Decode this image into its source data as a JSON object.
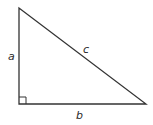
{
  "diagram": {
    "type": "right-triangle",
    "colors": {
      "stroke": "#333333",
      "background": "#ffffff",
      "text": "#2a2a2a"
    },
    "vertices": {
      "top": [
        19,
        8
      ],
      "right_angle": [
        19,
        104
      ],
      "right": [
        146,
        104
      ]
    },
    "right_angle_marker_size": 7,
    "labels": {
      "a": "a",
      "b": "b",
      "c": "c"
    }
  }
}
